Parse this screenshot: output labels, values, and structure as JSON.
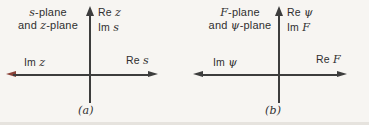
{
  "colors": {
    "background": "#f7f5f2",
    "axis": "#3d3d3d",
    "accent-arrow": "#8a4238",
    "text": "#2f2f2f"
  },
  "diagrams": [
    {
      "caption": "(a)",
      "title": {
        "line1_var": "s",
        "line1_rest": "-plane",
        "line2_pre": "and ",
        "line2_var": "z",
        "line2_rest": "-plane"
      },
      "vertical_labels": {
        "line1_pre": "Re ",
        "line1_var": "z",
        "line2_pre": "Im ",
        "line2_var": "s"
      },
      "left_label": {
        "pre": "Im ",
        "var": "z"
      },
      "right_label": {
        "pre": "Re ",
        "var": "s"
      }
    },
    {
      "caption": "(b)",
      "title": {
        "line1_var": "F",
        "line1_rest": "-plane",
        "line2_pre": "and ",
        "line2_var": "ψ",
        "line2_rest": "-plane"
      },
      "vertical_labels": {
        "line1_pre": "Re ",
        "line1_var": "ψ",
        "line2_pre": "Im ",
        "line2_var": "F"
      },
      "left_label": {
        "pre": "Im ",
        "var": "ψ"
      },
      "right_label": {
        "pre": "Re ",
        "var": "F"
      }
    }
  ]
}
